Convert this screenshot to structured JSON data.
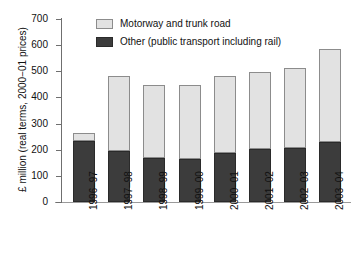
{
  "chart_data": {
    "type": "bar",
    "stacked": true,
    "title": "",
    "subtitle": "",
    "xlabel": "",
    "ylabel": "£ million (real terms, 2000−01 prices)",
    "ylim": [
      0,
      700
    ],
    "ytick_step": 100,
    "yticks": [
      0,
      100,
      200,
      300,
      400,
      500,
      600,
      700
    ],
    "ytick_labels": [
      "0",
      "100",
      "200",
      "300",
      "400",
      "500",
      "600",
      "700"
    ],
    "grid": false,
    "legend_position": "top-left-inside",
    "categories": [
      "1996‒97",
      "1997‒98",
      "1998‒99",
      "1999‒00",
      "2000‒01",
      "2001‒02",
      "2002‒03",
      "2003‒04"
    ],
    "series": [
      {
        "name": "Other (public transport including rail)",
        "color": "#3c3c3c",
        "values": [
          233,
          195,
          168,
          165,
          188,
          202,
          207,
          229
        ]
      },
      {
        "name": "Motorway and trunk road",
        "color": "#e2e2e2",
        "values": [
          32,
          287,
          280,
          283,
          294,
          296,
          306,
          356
        ]
      }
    ],
    "totals": [
      265,
      482,
      448,
      448,
      482,
      498,
      513,
      585
    ],
    "annotations": []
  },
  "legend": {
    "items": [
      {
        "label": "Motorway and trunk road",
        "swatch": "light-gray-swatch"
      },
      {
        "label": "Other (public transport including rail)",
        "swatch": "dark-gray-swatch"
      }
    ]
  },
  "axes": {
    "y_title": "£ million (real terms, 2000−01 prices)",
    "y_tick_labels": [
      "700",
      "600",
      "500",
      "400",
      "300",
      "200",
      "100",
      "0"
    ],
    "x_tick_labels": [
      "1996‒97",
      "1997‒98",
      "1998‒99",
      "1999‒00",
      "2000‒01",
      "2001‒02",
      "2002‒03",
      "2003‒04"
    ]
  },
  "colors": {
    "series_light": "#e2e2e2",
    "series_dark": "#3c3c3c",
    "axis": "#6f6f6f",
    "text": "#111111",
    "background": "#ffffff"
  }
}
